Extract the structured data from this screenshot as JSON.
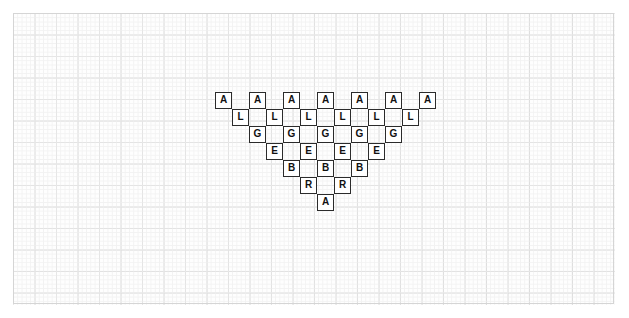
{
  "canvas": {
    "width": 629,
    "height": 318,
    "background_color": "#ffffff"
  },
  "graph_paper": {
    "name": "graph-paper-background",
    "left": 13,
    "top": 13,
    "width": 602,
    "height": 292,
    "major_grid_color": "#d5d5d5",
    "minor_grid_color": "#efefef",
    "major_grid_spacing": 21.5,
    "minor_grid_spacing": 4.3,
    "paper_color": "#fefefe"
  },
  "lattice": {
    "name": "letter-triangle",
    "description": "Triangular checkerboard lattice of bordered letter cells spelling ALGEBRA downward",
    "cell_size": 17,
    "column_step": 34,
    "row_step": 17,
    "origin_x": 215,
    "origin_y": 92,
    "cell_border_color": "#2b2b2b",
    "cell_fill_color": "#ffffff",
    "letter_color": "#111111",
    "word": "ALGEBRA",
    "rows": [
      {
        "index": 0,
        "letter": "A",
        "count": 7,
        "start_x": 215,
        "y": 92,
        "cells": [
          {
            "letter": "A",
            "x": 215,
            "y": 92
          },
          {
            "letter": "A",
            "x": 249,
            "y": 92
          },
          {
            "letter": "A",
            "x": 283,
            "y": 92
          },
          {
            "letter": "A",
            "x": 317,
            "y": 92
          },
          {
            "letter": "A",
            "x": 351,
            "y": 92
          },
          {
            "letter": "A",
            "x": 385,
            "y": 92
          },
          {
            "letter": "A",
            "x": 419,
            "y": 92
          }
        ]
      },
      {
        "index": 1,
        "letter": "L",
        "count": 6,
        "start_x": 232,
        "y": 109,
        "cells": [
          {
            "letter": "L",
            "x": 232,
            "y": 109
          },
          {
            "letter": "L",
            "x": 266,
            "y": 109
          },
          {
            "letter": "L",
            "x": 300,
            "y": 109
          },
          {
            "letter": "L",
            "x": 334,
            "y": 109
          },
          {
            "letter": "L",
            "x": 368,
            "y": 109
          },
          {
            "letter": "L",
            "x": 402,
            "y": 109
          }
        ]
      },
      {
        "index": 2,
        "letter": "G",
        "count": 5,
        "start_x": 249,
        "y": 126,
        "cells": [
          {
            "letter": "G",
            "x": 249,
            "y": 126
          },
          {
            "letter": "G",
            "x": 283,
            "y": 126
          },
          {
            "letter": "G",
            "x": 317,
            "y": 126
          },
          {
            "letter": "G",
            "x": 351,
            "y": 126
          },
          {
            "letter": "G",
            "x": 385,
            "y": 126
          }
        ]
      },
      {
        "index": 3,
        "letter": "E",
        "count": 4,
        "start_x": 266,
        "y": 143,
        "cells": [
          {
            "letter": "E",
            "x": 266,
            "y": 143
          },
          {
            "letter": "E",
            "x": 300,
            "y": 143
          },
          {
            "letter": "E",
            "x": 334,
            "y": 143
          },
          {
            "letter": "E",
            "x": 368,
            "y": 143
          }
        ]
      },
      {
        "index": 4,
        "letter": "B",
        "count": 3,
        "start_x": 283,
        "y": 160,
        "cells": [
          {
            "letter": "B",
            "x": 283,
            "y": 160
          },
          {
            "letter": "B",
            "x": 317,
            "y": 160
          },
          {
            "letter": "B",
            "x": 351,
            "y": 160
          }
        ]
      },
      {
        "index": 5,
        "letter": "R",
        "count": 2,
        "start_x": 300,
        "y": 177,
        "cells": [
          {
            "letter": "R",
            "x": 300,
            "y": 177
          },
          {
            "letter": "R",
            "x": 334,
            "y": 177
          }
        ]
      },
      {
        "index": 6,
        "letter": "A",
        "count": 1,
        "start_x": 317,
        "y": 194,
        "cells": [
          {
            "letter": "A",
            "x": 317,
            "y": 194
          }
        ]
      }
    ]
  }
}
